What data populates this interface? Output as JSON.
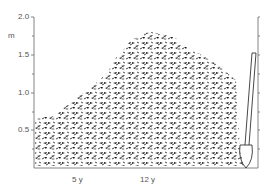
{
  "figure": {
    "y_axis": {
      "unit_label": "m",
      "ticks": [
        "2.0",
        "1.5",
        "1.0",
        "0.5"
      ]
    },
    "x_labels": [
      "5 y",
      "12 y"
    ],
    "colors": {
      "foliage": "#1a1a1a",
      "axis": "#666666",
      "text": "#555555"
    }
  }
}
